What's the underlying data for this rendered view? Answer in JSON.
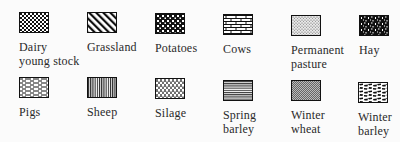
{
  "legend": {
    "items": [
      {
        "label": "Dairy\nyoung stock",
        "pattern": "fine-checker"
      },
      {
        "label": "Grassland",
        "pattern": "diagonal-hatch"
      },
      {
        "label": "Potatoes",
        "pattern": "coarse-checker"
      },
      {
        "label": "Cows",
        "pattern": "brick"
      },
      {
        "label": "Permanent\npasture",
        "pattern": "stipple"
      },
      {
        "label": "Hay",
        "pattern": "black-speckle"
      },
      {
        "label": "Pigs",
        "pattern": "dashed-horizontal"
      },
      {
        "label": "Sheep",
        "pattern": "vertical-lines"
      },
      {
        "label": "Silage",
        "pattern": "vertical-dashes"
      },
      {
        "label": "Spring\nbarley",
        "pattern": "horizontal-lines"
      },
      {
        "label": "Winter\nwheat",
        "pattern": "fine-crosshatch"
      },
      {
        "label": "Winter\nbarley",
        "pattern": "blotch"
      }
    ]
  }
}
